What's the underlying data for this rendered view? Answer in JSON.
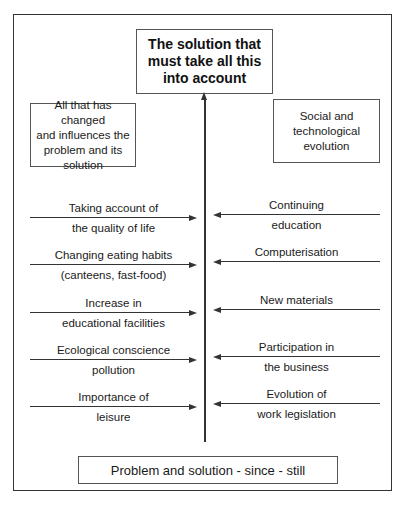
{
  "title_box": {
    "lines": [
      "The solution that",
      "must take all this",
      "into account"
    ]
  },
  "left_header": {
    "lines": [
      "All that has changed",
      "and influences the",
      "problem and its",
      "solution"
    ]
  },
  "right_header": {
    "lines": [
      "Social and",
      "technological",
      "evolution"
    ]
  },
  "left_items": [
    {
      "above": "Taking account of",
      "below": "the quality of life"
    },
    {
      "above": "Changing eating habits",
      "below": "(canteens, fast-food)"
    },
    {
      "above": "Increase in",
      "below": "educational facilities"
    },
    {
      "above": "Ecological conscience",
      "below": "pollution"
    },
    {
      "above": "Importance of",
      "below": "leisure"
    }
  ],
  "right_items": [
    {
      "above": "Continuing",
      "below": "education"
    },
    {
      "above": "Computerisation",
      "below": ""
    },
    {
      "above": "New materials",
      "below": ""
    },
    {
      "above": "Participation in",
      "below": "the business"
    },
    {
      "above": "Evolution of",
      "below": "work legislation"
    }
  ],
  "bottom_box": {
    "text": "Problem and solution - since - still"
  }
}
